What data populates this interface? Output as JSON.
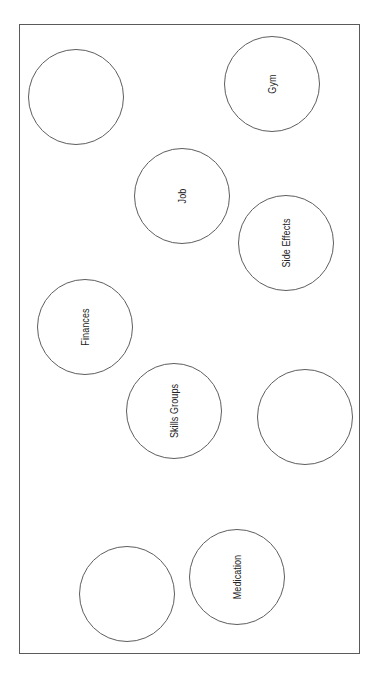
{
  "diagram": {
    "type": "bubble-map",
    "orientation": "rotated -90deg (labels read bottom-to-top)",
    "frame": {
      "x": 19,
      "y": 24,
      "width": 341,
      "height": 630
    },
    "colors": {
      "frame_stroke": "#5a5a5a",
      "circle_stroke": "#5e5e5e",
      "text": "#222222",
      "background": "#ffffff"
    },
    "bubbles": [
      {
        "id": "empty-1",
        "label": "",
        "cx": 76,
        "cy": 97,
        "r": 48
      },
      {
        "id": "gym",
        "label": "Gym",
        "cx": 272,
        "cy": 84,
        "r": 48
      },
      {
        "id": "job",
        "label": "Job",
        "cx": 182,
        "cy": 196,
        "r": 48
      },
      {
        "id": "side-effects",
        "label": "Side Effects",
        "cx": 286,
        "cy": 243,
        "r": 48
      },
      {
        "id": "finances",
        "label": "Finances",
        "cx": 85,
        "cy": 327,
        "r": 48
      },
      {
        "id": "skills-groups",
        "label": "Skills Groups",
        "cx": 174,
        "cy": 411,
        "r": 48
      },
      {
        "id": "empty-2",
        "label": "",
        "cx": 305,
        "cy": 417,
        "r": 48
      },
      {
        "id": "empty-3",
        "label": "",
        "cx": 127,
        "cy": 594,
        "r": 48
      },
      {
        "id": "medication",
        "label": "Medication",
        "cx": 237,
        "cy": 577,
        "r": 48
      }
    ]
  }
}
